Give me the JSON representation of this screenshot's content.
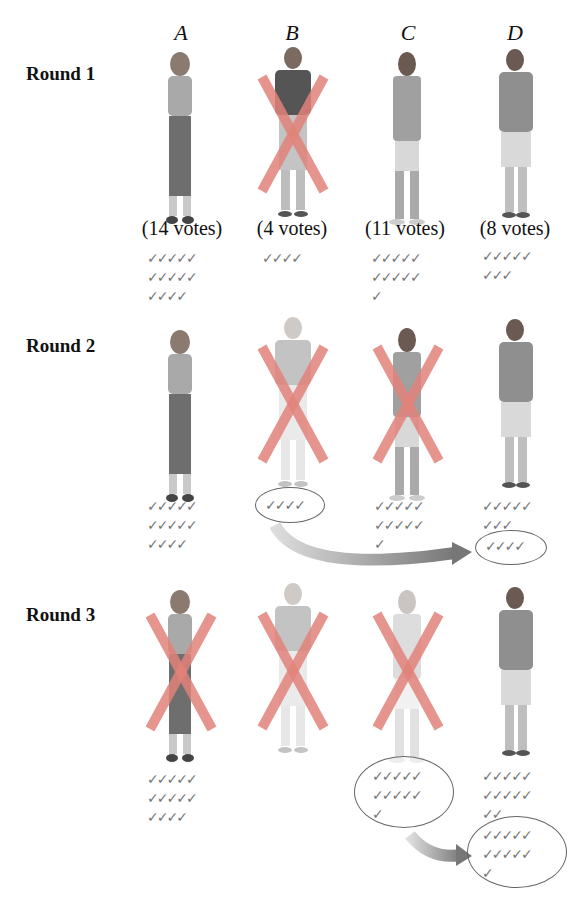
{
  "columns": [
    "A",
    "B",
    "C",
    "D"
  ],
  "rounds": [
    {
      "label": "Round 1",
      "candidates": [
        {
          "id": "A",
          "votes_label": "(14 votes)",
          "checks": 14,
          "eliminated": false
        },
        {
          "id": "B",
          "votes_label": "(4 votes)",
          "checks": 4,
          "eliminated": true
        },
        {
          "id": "C",
          "votes_label": "(11 votes)",
          "checks": 11,
          "eliminated": false
        },
        {
          "id": "D",
          "votes_label": "(8 votes)",
          "checks": 8,
          "eliminated": false
        }
      ]
    },
    {
      "label": "Round 2",
      "candidates": [
        {
          "id": "A",
          "checks": 14,
          "eliminated": false
        },
        {
          "id": "B",
          "checks": 4,
          "eliminated": true,
          "faded": true,
          "circled": true
        },
        {
          "id": "C",
          "checks": 11,
          "eliminated": true
        },
        {
          "id": "D",
          "checks": 8,
          "eliminated": false,
          "transferred": 4
        }
      ],
      "transfer": {
        "from": "B",
        "to": "D",
        "count": 4
      }
    },
    {
      "label": "Round 3",
      "candidates": [
        {
          "id": "A",
          "checks": 14,
          "eliminated": true
        },
        {
          "id": "B",
          "checks": 0,
          "eliminated": true,
          "faded": true
        },
        {
          "id": "C",
          "checks": 11,
          "eliminated": true,
          "faded": true,
          "circled": true
        },
        {
          "id": "D",
          "checks": 12,
          "eliminated": false,
          "transferred": 11
        }
      ],
      "transfer": {
        "from": "C",
        "to": "D",
        "count": 11
      }
    }
  ],
  "colors": {
    "cross": "#e0837a",
    "check": "#7a7a7a",
    "text": "#111111"
  },
  "check_rows": {
    "c14": "✓✓✓✓✓\n✓✓✓✓✓\n✓✓✓✓",
    "c4": "✓✓✓✓",
    "c11": "✓✓✓✓✓\n✓✓✓✓✓\n✓",
    "c8": "✓✓✓✓✓\n✓✓✓",
    "c12": "✓✓✓✓✓\n✓✓✓✓✓\n✓✓"
  }
}
